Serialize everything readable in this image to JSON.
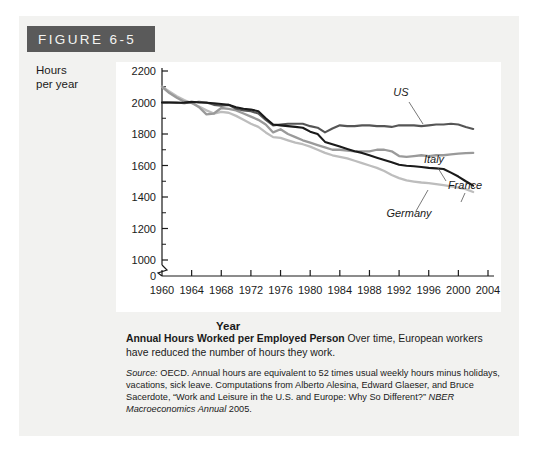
{
  "figure": {
    "banner_label": "FIGURE 6-5"
  },
  "axes": {
    "y_title_line1": "Hours",
    "y_title_line2": "per year",
    "x_title": "Year",
    "y_ticks": [
      "2200",
      "2000",
      "1800",
      "1600",
      "1400",
      "1200",
      "1000",
      "0"
    ],
    "x_ticks": [
      "1960",
      "1964",
      "1968",
      "1972",
      "1976",
      "1980",
      "1984",
      "1988",
      "1992",
      "1996",
      "2000",
      "2004"
    ]
  },
  "series_labels": {
    "us": "US",
    "italy": "Italy",
    "france": "France",
    "germany": "Germany"
  },
  "caption": {
    "title": "Annual Hours Worked per Employed Person",
    "body": "Over time, European workers have reduced the number of hours they work.",
    "source_label": "Source:",
    "source_body": "OECD. Annual hours are equivalent to 52 times usual weekly hours minus holidays, vacations, sick leave. Computations from Alberto Alesina, Edward Glaeser, and Bruce Sacerdote, “Work and Leisure in the U.S. and Europe: Why So Different?”",
    "source_journal": "NBER Macroeconomics Annual",
    "source_year": "2005."
  },
  "colors": {
    "banner_bg": "#5a5a5a",
    "page_bg": "#f2f2f0",
    "plot_bg": "#ffffff",
    "axis": "#1a1a1a",
    "us": "#555555",
    "italy": "#9a9a9a",
    "france": "#1a1a1a",
    "germany": "#bdbdbd"
  },
  "chart_data": {
    "type": "line",
    "title": "Annual Hours Worked per Employed Person",
    "xlabel": "Year",
    "ylabel": "Hours per year",
    "xlim": [
      1960,
      2004
    ],
    "ylim": [
      950,
      2250
    ],
    "y_axis_break": true,
    "grid": false,
    "legend": "inline-labels",
    "x": [
      1960,
      1961,
      1962,
      1963,
      1964,
      1965,
      1966,
      1967,
      1968,
      1969,
      1970,
      1971,
      1972,
      1973,
      1974,
      1975,
      1976,
      1977,
      1978,
      1979,
      1980,
      1981,
      1982,
      1983,
      1984,
      1985,
      1986,
      1987,
      1988,
      1989,
      1990,
      1991,
      1992,
      1993,
      1994,
      1995,
      1996,
      1997,
      1998,
      1999,
      2000,
      2001,
      2002
    ],
    "series": [
      {
        "name": "US",
        "color": "#555555",
        "values": [
          2000,
          2000,
          2000,
          1995,
          2000,
          2005,
          2000,
          1985,
          1980,
          1985,
          1960,
          1950,
          1945,
          1930,
          1890,
          1855,
          1860,
          1865,
          1865,
          1865,
          1850,
          1840,
          1810,
          1835,
          1855,
          1850,
          1850,
          1855,
          1855,
          1850,
          1850,
          1845,
          1855,
          1855,
          1855,
          1850,
          1855,
          1860,
          1860,
          1865,
          1860,
          1845,
          1832
        ]
      },
      {
        "name": "Italy",
        "color": "#9a9a9a",
        "values": [
          2100,
          2060,
          2030,
          2005,
          2000,
          1970,
          1925,
          1930,
          1965,
          1960,
          1950,
          1930,
          1910,
          1890,
          1860,
          1810,
          1830,
          1800,
          1780,
          1760,
          1745,
          1730,
          1715,
          1700,
          1700,
          1695,
          1690,
          1690,
          1690,
          1700,
          1700,
          1690,
          1660,
          1655,
          1660,
          1665,
          1660,
          1665,
          1665,
          1670,
          1675,
          1678,
          1680
        ]
      },
      {
        "name": "France",
        "color": "#1a1a1a",
        "values": [
          2000,
          2000,
          1998,
          2000,
          2005,
          2000,
          1998,
          1995,
          1990,
          1985,
          1970,
          1960,
          1955,
          1945,
          1900,
          1860,
          1855,
          1850,
          1845,
          1840,
          1815,
          1800,
          1750,
          1735,
          1720,
          1705,
          1690,
          1680,
          1665,
          1650,
          1635,
          1620,
          1605,
          1598,
          1595,
          1590,
          1585,
          1582,
          1578,
          1555,
          1530,
          1500,
          1472
        ]
      },
      {
        "name": "Germany",
        "color": "#bdbdbd",
        "values": [
          2100,
          2070,
          2040,
          2015,
          1995,
          1975,
          1950,
          1930,
          1940,
          1935,
          1915,
          1890,
          1865,
          1845,
          1810,
          1780,
          1775,
          1760,
          1745,
          1735,
          1720,
          1700,
          1680,
          1665,
          1655,
          1645,
          1630,
          1615,
          1600,
          1585,
          1565,
          1540,
          1520,
          1505,
          1498,
          1492,
          1488,
          1482,
          1475,
          1468,
          1460,
          1450,
          1432
        ]
      }
    ]
  }
}
